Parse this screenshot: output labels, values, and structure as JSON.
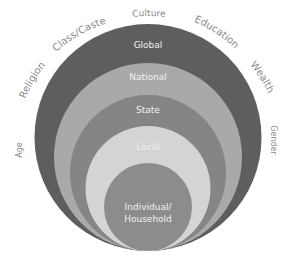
{
  "diagram": {
    "type": "nested-circles",
    "levels": [
      {
        "label": "Global",
        "color": "#5e5e5e"
      },
      {
        "label": "National",
        "color": "#a9a9a9"
      },
      {
        "label": "State",
        "color": "#858585"
      },
      {
        "label": "Local",
        "color": "#d4d4d4"
      },
      {
        "label": "Individual/",
        "label2": "Household",
        "color": "#8c8c8c"
      }
    ],
    "factors": [
      "Age",
      "Religion",
      "Class/Caste",
      "Culture",
      "Education",
      "Wealth",
      "Gender"
    ]
  }
}
